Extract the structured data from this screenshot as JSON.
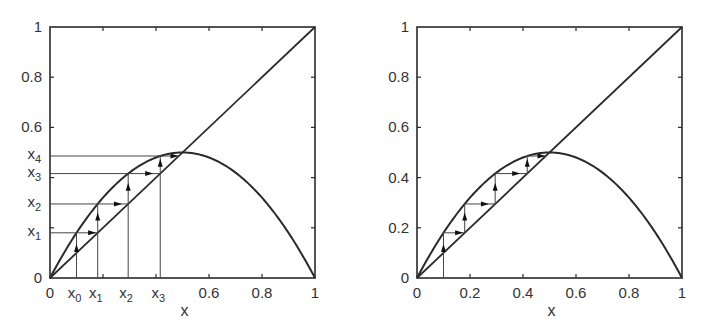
{
  "chart_data": [
    {
      "type": "line",
      "title": "",
      "description": "Cobweb diagram of logistic map f(x)=2x(1-x) with diagonal y=x",
      "xlabel": "x",
      "ylabel": "",
      "xlim": [
        0,
        1
      ],
      "ylim": [
        0,
        1
      ],
      "grid": false,
      "x_ticks": [
        0,
        0.2,
        0.4,
        0.6,
        0.8,
        1
      ],
      "x_tick_labels": [
        "0",
        "x0",
        "x1",
        "x2",
        "x3",
        "0.6",
        "0.8",
        "1"
      ],
      "y_tick_labels": [
        "0",
        "x1",
        "x2",
        "x3",
        "x4",
        "0.6",
        "0.8",
        "1"
      ],
      "series": [
        {
          "name": "y = x",
          "x": [
            0,
            1
          ],
          "y": [
            0,
            1
          ]
        },
        {
          "name": "f(x) = 2x(1-x)",
          "x": [
            0,
            0.1,
            0.2,
            0.3,
            0.4,
            0.5,
            0.6,
            0.7,
            0.8,
            0.9,
            1
          ],
          "y": [
            0,
            0.18,
            0.32,
            0.42,
            0.48,
            0.5,
            0.48,
            0.42,
            0.32,
            0.18,
            0
          ]
        }
      ],
      "iterates": [
        0.1,
        0.18,
        0.295,
        0.416,
        0.486
      ],
      "iterate_labels": [
        "x0",
        "x1",
        "x2",
        "x3",
        "x4"
      ]
    },
    {
      "type": "line",
      "title": "",
      "description": "Cobweb diagram of logistic map f(x)=2x(1-x) with diagonal y=x",
      "xlabel": "x",
      "ylabel": "",
      "xlim": [
        0,
        1
      ],
      "ylim": [
        0,
        1
      ],
      "grid": false,
      "x_tick_labels": [
        "0",
        "0.2",
        "0.4",
        "0.6",
        "0.8",
        "1"
      ],
      "y_tick_labels": [
        "0",
        "0.2",
        "0.4",
        "0.6",
        "0.8",
        "1"
      ],
      "series": [
        {
          "name": "y = x",
          "x": [
            0,
            1
          ],
          "y": [
            0,
            1
          ]
        },
        {
          "name": "f(x) = 2x(1-x)",
          "x": [
            0,
            0.1,
            0.2,
            0.3,
            0.4,
            0.5,
            0.6,
            0.7,
            0.8,
            0.9,
            1
          ],
          "y": [
            0,
            0.18,
            0.32,
            0.42,
            0.48,
            0.5,
            0.48,
            0.42,
            0.32,
            0.18,
            0
          ]
        }
      ],
      "iterates": [
        0.1,
        0.18,
        0.295,
        0.416,
        0.486
      ]
    }
  ],
  "left": {
    "xlabel": "x",
    "y_labels": {
      "one": "1",
      "p8": "0.8",
      "p6": "0.6",
      "zero": "0"
    },
    "x_labels": {
      "zero": "0",
      "p6": "0.6",
      "p8": "0.8",
      "one": "1"
    },
    "iter_sub": [
      "0",
      "1",
      "2",
      "3",
      "4"
    ],
    "iter_base": "x"
  },
  "right": {
    "xlabel": "x",
    "y_labels": [
      "0",
      "0.2",
      "0.4",
      "0.6",
      "0.8",
      "1"
    ],
    "x_labels": [
      "0",
      "0.2",
      "0.4",
      "0.6",
      "0.8",
      "1"
    ]
  }
}
